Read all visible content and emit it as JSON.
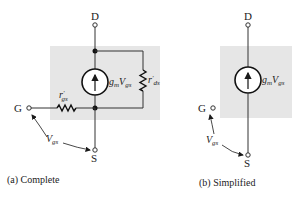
{
  "panels": [
    {
      "id": "complete",
      "caption": "(a) Complete",
      "terminals": {
        "drain": "D",
        "gate": "G",
        "source": "S"
      },
      "current_source": {
        "label_g": "g",
        "label_m": "m",
        "label_V": "V",
        "label_gs": "gs"
      },
      "resistor_rgs": {
        "label_r": "r",
        "label_prime": "′",
        "label_sub": "gs"
      },
      "resistor_rds": {
        "label_r": "r",
        "label_prime": "′",
        "label_sub": "ds"
      },
      "voltage": {
        "label_V": "V",
        "label_sub": "gs"
      }
    },
    {
      "id": "simplified",
      "caption": "(b) Simplified",
      "terminals": {
        "drain": "D",
        "gate": "G",
        "source": "S"
      },
      "current_source": {
        "label_g": "g",
        "label_m": "m",
        "label_V": "V",
        "label_gs": "gs"
      },
      "voltage": {
        "label_V": "V",
        "label_sub": "gs"
      }
    }
  ],
  "colors": {
    "box_fill": "#e6e6e6",
    "wire": "#333333",
    "node": "#111111",
    "arrow": "#1a1a1a"
  }
}
